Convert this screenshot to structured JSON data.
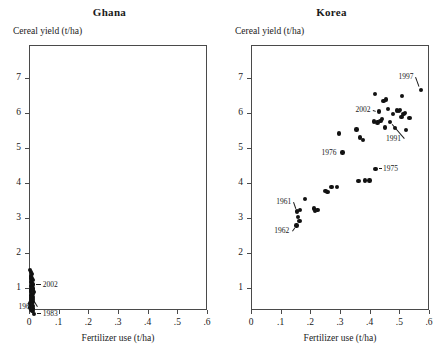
{
  "figure": {
    "width": 438,
    "height": 352,
    "background": "#ffffff",
    "dot_color": "#121212",
    "axis_color": "#4a4a4a"
  },
  "chart_data": [
    {
      "type": "scatter",
      "title": "Ghana",
      "xlabel": "Fertilizer use (t/ha)",
      "ylabel": "Cereal yield (t/ha)",
      "xlim": [
        0,
        0.6
      ],
      "ylim": [
        0,
        7.6
      ],
      "xticks": [
        0,
        0.1,
        0.2,
        0.3,
        0.4,
        0.5,
        0.6
      ],
      "xticklabels": [
        "0",
        ".1",
        ".2",
        ".3",
        ".4",
        ".5",
        ".6"
      ],
      "yticks": [
        1,
        2,
        3,
        4,
        5,
        6,
        7
      ],
      "yticklabels": [
        "1",
        "2",
        "3",
        "4",
        "5",
        "6",
        "7"
      ],
      "grid": false,
      "legend": "none",
      "points": [
        {
          "x": 0.004,
          "y": 1.52
        },
        {
          "x": 0.006,
          "y": 1.45
        },
        {
          "x": 0.01,
          "y": 1.4
        },
        {
          "x": 0.007,
          "y": 1.33
        },
        {
          "x": 0.009,
          "y": 1.27
        },
        {
          "x": 0.012,
          "y": 1.22
        },
        {
          "x": 0.006,
          "y": 1.18
        },
        {
          "x": 0.01,
          "y": 1.13
        },
        {
          "x": 0.013,
          "y": 1.1
        },
        {
          "x": 0.008,
          "y": 1.06
        },
        {
          "x": 0.011,
          "y": 1.02
        },
        {
          "x": 0.014,
          "y": 0.99
        },
        {
          "x": 0.009,
          "y": 0.96
        },
        {
          "x": 0.012,
          "y": 0.93
        },
        {
          "x": 0.007,
          "y": 0.9
        },
        {
          "x": 0.015,
          "y": 0.88
        },
        {
          "x": 0.01,
          "y": 0.85
        },
        {
          "x": 0.013,
          "y": 0.82
        },
        {
          "x": 0.008,
          "y": 0.79
        },
        {
          "x": 0.011,
          "y": 0.76
        },
        {
          "x": 0.014,
          "y": 0.74
        },
        {
          "x": 0.009,
          "y": 0.71
        },
        {
          "x": 0.012,
          "y": 0.68
        },
        {
          "x": 0.006,
          "y": 0.66
        },
        {
          "x": 0.01,
          "y": 0.63
        },
        {
          "x": 0.013,
          "y": 0.61
        },
        {
          "x": 0.008,
          "y": 0.58
        },
        {
          "x": 0.004,
          "y": 0.56
        },
        {
          "x": 0.011,
          "y": 0.54
        },
        {
          "x": 0.007,
          "y": 0.51
        },
        {
          "x": 0.014,
          "y": 0.49
        },
        {
          "x": 0.009,
          "y": 0.46
        },
        {
          "x": 0.005,
          "y": 0.44
        },
        {
          "x": 0.012,
          "y": 0.41
        },
        {
          "x": 0.008,
          "y": 0.39
        },
        {
          "x": 0.01,
          "y": 0.36
        },
        {
          "x": 0.013,
          "y": 0.34
        },
        {
          "x": 0.017,
          "y": 0.25
        }
      ],
      "annotations": [
        {
          "text": "2002",
          "x": 0.046,
          "y": 1.08,
          "point_x": 0.014,
          "point_y": 1.08,
          "leader": true
        },
        {
          "text": "1983",
          "x": 0.046,
          "y": 0.25,
          "point_x": 0.017,
          "point_y": 0.25,
          "leader": true
        },
        {
          "text": "1961",
          "x": -0.035,
          "y": 0.47,
          "point_x": 0.009,
          "point_y": 0.7,
          "leader": true
        },
        {
          "text": "1",
          "x": 0.004,
          "y": 0.92,
          "leader": false
        }
      ]
    },
    {
      "type": "scatter",
      "title": "Korea",
      "xlabel": "Fertilizer use (t/ha)",
      "ylabel": "Cereal yield (t/ha)",
      "xlim": [
        0,
        0.6
      ],
      "ylim": [
        0,
        7.6
      ],
      "xticks": [
        0,
        0.1,
        0.2,
        0.3,
        0.4,
        0.5,
        0.6
      ],
      "xticklabels": [
        "0",
        ".1",
        ".2",
        ".3",
        ".4",
        ".5",
        ".6"
      ],
      "yticks": [
        1,
        2,
        3,
        4,
        5,
        6,
        7
      ],
      "yticklabels": [
        "1",
        "2",
        "3",
        "4",
        "5",
        "6",
        "7"
      ],
      "grid": false,
      "legend": "none",
      "points": [
        {
          "x": 0.156,
          "y": 3.19
        },
        {
          "x": 0.166,
          "y": 3.22
        },
        {
          "x": 0.158,
          "y": 3.03
        },
        {
          "x": 0.163,
          "y": 2.92
        },
        {
          "x": 0.153,
          "y": 2.79
        },
        {
          "x": 0.182,
          "y": 3.55
        },
        {
          "x": 0.212,
          "y": 3.27
        },
        {
          "x": 0.215,
          "y": 3.2
        },
        {
          "x": 0.224,
          "y": 3.23
        },
        {
          "x": 0.251,
          "y": 3.77
        },
        {
          "x": 0.258,
          "y": 3.74
        },
        {
          "x": 0.272,
          "y": 3.88
        },
        {
          "x": 0.29,
          "y": 3.89
        },
        {
          "x": 0.297,
          "y": 5.41
        },
        {
          "x": 0.308,
          "y": 4.87
        },
        {
          "x": 0.356,
          "y": 5.53
        },
        {
          "x": 0.362,
          "y": 4.06
        },
        {
          "x": 0.368,
          "y": 5.3
        },
        {
          "x": 0.378,
          "y": 5.22
        },
        {
          "x": 0.385,
          "y": 4.07
        },
        {
          "x": 0.399,
          "y": 4.07
        },
        {
          "x": 0.414,
          "y": 5.76
        },
        {
          "x": 0.417,
          "y": 6.55
        },
        {
          "x": 0.42,
          "y": 4.4
        },
        {
          "x": 0.426,
          "y": 5.73
        },
        {
          "x": 0.431,
          "y": 6.04
        },
        {
          "x": 0.436,
          "y": 5.78
        },
        {
          "x": 0.441,
          "y": 5.83
        },
        {
          "x": 0.447,
          "y": 6.35
        },
        {
          "x": 0.451,
          "y": 5.59
        },
        {
          "x": 0.456,
          "y": 6.39
        },
        {
          "x": 0.461,
          "y": 6.12
        },
        {
          "x": 0.468,
          "y": 5.74
        },
        {
          "x": 0.479,
          "y": 5.97
        },
        {
          "x": 0.486,
          "y": 5.57
        },
        {
          "x": 0.492,
          "y": 6.07
        },
        {
          "x": 0.498,
          "y": 6.05
        },
        {
          "x": 0.503,
          "y": 6.08
        },
        {
          "x": 0.507,
          "y": 5.88
        },
        {
          "x": 0.509,
          "y": 6.48
        },
        {
          "x": 0.514,
          "y": 5.98
        },
        {
          "x": 0.519,
          "y": 6.0
        },
        {
          "x": 0.523,
          "y": 5.52
        },
        {
          "x": 0.534,
          "y": 5.86
        },
        {
          "x": 0.573,
          "y": 6.66
        }
      ],
      "annotations": [
        {
          "text": "1997",
          "x": 0.497,
          "y": 7.02,
          "point_x": 0.573,
          "point_y": 6.66,
          "leader": true
        },
        {
          "text": "2002",
          "x": 0.352,
          "y": 6.09,
          "point_x": 0.431,
          "point_y": 6.04,
          "leader": true
        },
        {
          "text": "1991",
          "x": 0.455,
          "y": 5.27,
          "point_x": 0.468,
          "point_y": 5.74,
          "leader": true
        },
        {
          "text": "1976",
          "x": 0.238,
          "y": 4.87,
          "point_x": 0.308,
          "point_y": 4.87,
          "leader": true
        },
        {
          "text": "1975",
          "x": 0.445,
          "y": 4.4,
          "point_x": 0.42,
          "point_y": 4.4,
          "leader": true
        },
        {
          "text": "1961",
          "x": 0.085,
          "y": 3.45,
          "point_x": 0.156,
          "point_y": 3.19,
          "leader": true
        },
        {
          "text": "1962",
          "x": 0.078,
          "y": 2.62,
          "point_x": 0.153,
          "point_y": 2.79,
          "leader": true
        }
      ]
    }
  ],
  "panels": [
    {
      "title": "Ghana",
      "ylabel": "Cereal yield (t/ha)",
      "xlabel": "Fertilizer use (t/ha)",
      "offset_x": 0,
      "box": {
        "left": 29,
        "top": 45,
        "width": 178,
        "height": 265
      }
    },
    {
      "title": "Korea",
      "ylabel": "Cereal yield (t/ha)",
      "xlabel": "Fertilizer use (t/ha)",
      "offset_x": 222,
      "box": {
        "left": 29,
        "top": 45,
        "width": 178,
        "height": 265
      }
    }
  ]
}
